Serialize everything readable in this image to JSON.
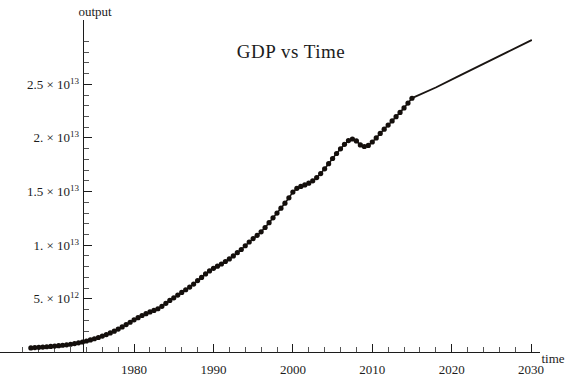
{
  "chart_data": {
    "type": "line",
    "title": "GDP vs Time",
    "xlabel": "time",
    "ylabel": "output",
    "xlim": [
      1965,
      2031
    ],
    "ylim": [
      0,
      29500000000000
    ],
    "grid": false,
    "legend": null,
    "x_tick_labels": [
      "1980",
      "1990",
      "2000",
      "2010",
      "2020",
      "2030"
    ],
    "x_tick_values": [
      1980,
      1990,
      2000,
      2010,
      2020,
      2030
    ],
    "x_minor_step": 2,
    "y_tick_labels": [
      "5. × 10¹²",
      "1. × 10¹³",
      "1.5 × 10¹³",
      "2. × 10¹³",
      "2.5 × 10¹³"
    ],
    "y_ticks": [
      {
        "mantissa": "5.",
        "exponent": "12",
        "value": 5000000000000
      },
      {
        "mantissa": "1.",
        "exponent": "13",
        "value": 10000000000000
      },
      {
        "mantissa": "1.5",
        "exponent": "13",
        "value": 15000000000000
      },
      {
        "mantissa": "2.",
        "exponent": "13",
        "value": 20000000000000
      },
      {
        "mantissa": "2.5",
        "exponent": "13",
        "value": 25000000000000
      }
    ],
    "y_minor_per_interval": 4,
    "series": [
      {
        "name": "observed",
        "style": "dots-with-line",
        "color": "#140f0c",
        "x": [
          1967.0,
          1967.5,
          1968.0,
          1968.5,
          1969.0,
          1969.5,
          1970.0,
          1970.5,
          1971.0,
          1971.5,
          1972.0,
          1972.5,
          1973.0,
          1973.5,
          1974.0,
          1974.5,
          1975.0,
          1975.5,
          1976.0,
          1976.5,
          1977.0,
          1977.5,
          1978.0,
          1978.5,
          1979.0,
          1979.5,
          1980.0,
          1980.5,
          1981.0,
          1981.5,
          1982.0,
          1982.5,
          1983.0,
          1983.5,
          1984.0,
          1984.5,
          1985.0,
          1985.5,
          1986.0,
          1986.5,
          1987.0,
          1987.5,
          1988.0,
          1988.5,
          1989.0,
          1989.5,
          1990.0,
          1990.5,
          1991.0,
          1991.5,
          1992.0,
          1992.5,
          1993.0,
          1993.5,
          1994.0,
          1994.5,
          1995.0,
          1995.5,
          1996.0,
          1996.5,
          1997.0,
          1997.5,
          1998.0,
          1998.5,
          1999.0,
          1999.5,
          2000.0,
          2000.5,
          2001.0,
          2001.5,
          2002.0,
          2002.5,
          2003.0,
          2003.5,
          2004.0,
          2004.5,
          2005.0,
          2005.5,
          2006.0,
          2006.5,
          2007.0,
          2007.5,
          2008.0,
          2008.5,
          2009.0,
          2009.5,
          2010.0,
          2010.5,
          2011.0,
          2011.5,
          2012.0,
          2012.5,
          2013.0,
          2013.5,
          2014.0,
          2014.5,
          2015.0
        ],
        "y": [
          430000000000.0,
          455000000000.0,
          480000000000.0,
          505000000000.0,
          535000000000.0,
          565000000000.0,
          600000000000.0,
          635000000000.0,
          675000000000.0,
          720000000000.0,
          770000000000.0,
          830000000000.0,
          900000000000.0,
          980000000000.0,
          1070000000000.0,
          1170000000000.0,
          1280000000000.0,
          1400000000000.0,
          1530000000000.0,
          1670000000000.0,
          1820000000000.0,
          1990000000000.0,
          2180000000000.0,
          2380000000000.0,
          2600000000000.0,
          2820000000000.0,
          3050000000000.0,
          3250000000000.0,
          3450000000000.0,
          3620000000000.0,
          3780000000000.0,
          3920000000000.0,
          4080000000000.0,
          4300000000000.0,
          4580000000000.0,
          4850000000000.0,
          5100000000000.0,
          5350000000000.0,
          5600000000000.0,
          5850000000000.0,
          6100000000000.0,
          6380000000000.0,
          6700000000000.0,
          7000000000000.0,
          7320000000000.0,
          7600000000000.0,
          7850000000000.0,
          8050000000000.0,
          8250000000000.0,
          8480000000000.0,
          8720000000000.0,
          9000000000000.0,
          9300000000000.0,
          9600000000000.0,
          9950000000000.0,
          10300000000000.0,
          10620000000000.0,
          10920000000000.0,
          11250000000000.0,
          11650000000000.0,
          12100000000000.0,
          12550000000000.0,
          13000000000000.0,
          13450000000000.0,
          13920000000000.0,
          14420000000000.0,
          14950000000000.0,
          15300000000000.0,
          15480000000000.0,
          15620000000000.0,
          15780000000000.0,
          16000000000000.0,
          16300000000000.0,
          16680000000000.0,
          17120000000000.0,
          17600000000000.0,
          18080000000000.0,
          18550000000000.0,
          18980000000000.0,
          19400000000000.0,
          19750000000000.0,
          19900000000000.0,
          19720000000000.0,
          19350000000000.0,
          19200000000000.0,
          19300000000000.0,
          19620000000000.0,
          20000000000000.0,
          20420000000000.0,
          20820000000000.0,
          21200000000000.0,
          21580000000000.0,
          21980000000000.0,
          22380000000000.0,
          22800000000000.0,
          23250000000000.0,
          23700000000000.0
        ],
        "note": "dots at roughly half-year intervals; dip visible near 2008-2009"
      },
      {
        "name": "extrapolation",
        "style": "line",
        "color": "#1a1512",
        "x": [
          2015.0,
          2018.0,
          2021.0,
          2024.0,
          2027.0,
          2030.0
        ],
        "y": [
          23700000000000.0,
          24700000000000.0,
          25800000000000.0,
          26900000000000.0,
          28000000000000.0,
          29100000000000.0
        ],
        "note": "smooth continuation of trend, no markers"
      }
    ],
    "annotations": [
      {
        "text": "2008-2009 dip",
        "x": 2008.6,
        "y": 19200000000000.0,
        "visible": false
      }
    ]
  },
  "labels": {
    "title": "GDP vs Time",
    "y_axis_name": "output",
    "x_axis_name": "time"
  }
}
